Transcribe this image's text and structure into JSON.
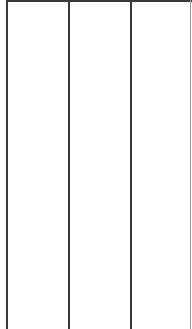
{
  "table": {
    "columns": [
      {
        "label": "",
        "cells": []
      },
      {
        "label": "",
        "cells": []
      },
      {
        "label": "",
        "cells": []
      }
    ],
    "border_color": "#3a3a3a",
    "faint_border_color": "#9a9a9a"
  }
}
